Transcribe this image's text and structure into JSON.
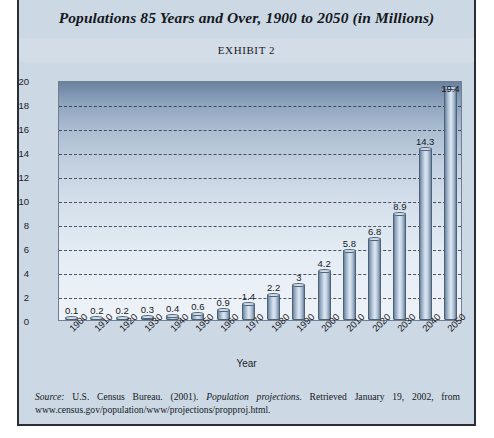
{
  "document": {
    "title": "Populations 85 Years and Over, 1900 to 2050 (in Millions)",
    "exhibit_label": "EXHIBIT 2",
    "source_prefix": "Source:",
    "source_body_1": " U.S. Census Bureau. (2001). ",
    "source_italic": "Population projections.",
    "source_body_2": " Retrieved January 19, 2002, from www.census.gov/population/www/projections/propproj.html."
  },
  "chart_data": {
    "type": "bar",
    "title": "Populations 85 Years and Over, 1900 to 2050 (in Millions)",
    "xlabel": "Year",
    "ylabel": "",
    "ylim": [
      0,
      20
    ],
    "yticks": [
      0,
      2,
      4,
      6,
      8,
      10,
      12,
      14,
      16,
      18,
      20
    ],
    "grid": true,
    "legend": "none",
    "categories": [
      "1900",
      "1910",
      "1920",
      "1930",
      "1940",
      "1950",
      "1960",
      "1970",
      "1980",
      "1990",
      "2000",
      "2010",
      "2020",
      "2030",
      "2040",
      "2050"
    ],
    "values": [
      0.1,
      0.2,
      0.2,
      0.3,
      0.4,
      0.6,
      0.9,
      1.4,
      2.2,
      3,
      4.2,
      5.8,
      6.8,
      8.9,
      14.3,
      19.4
    ],
    "data_labels": [
      "0.1",
      "0.2",
      "0.2",
      "0.3",
      "0.4",
      "0.6",
      "0.9",
      "1.4",
      "2.2",
      "3",
      "4.2",
      "5.8",
      "6.8",
      "8.9",
      "14.3",
      "19.4"
    ]
  },
  "colors": {
    "paper": "#ccd8e4",
    "frame": "#2a2f36",
    "bar_light": "#dde7f1",
    "bar_dark": "#6b7e97",
    "plot_top": "#6b82a0",
    "plot_bottom": "#eef3f8"
  }
}
